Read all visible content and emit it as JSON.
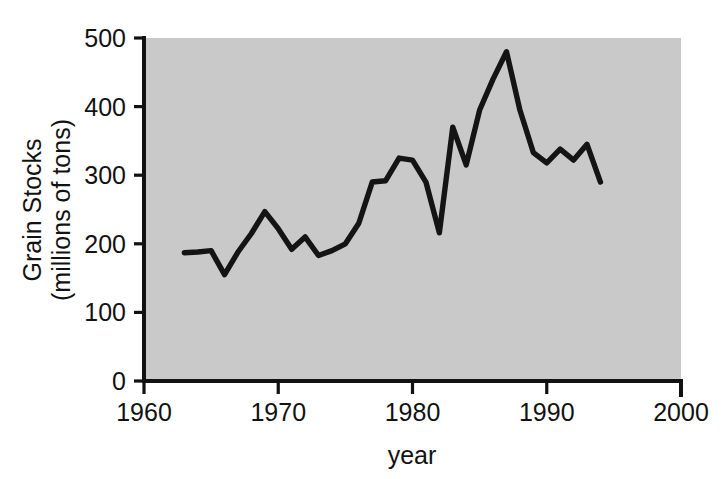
{
  "chart_data": {
    "type": "line",
    "title": "",
    "subtitle": "",
    "xlabel": "year",
    "ylabel_line1": "Grain Stocks",
    "ylabel_line2": "(millions of tons)",
    "ylabel": "Grain Stocks (millions of tons)",
    "xlim": [
      1960,
      2000
    ],
    "ylim": [
      0,
      500
    ],
    "xticks": [
      1960,
      1970,
      1980,
      1990,
      2000
    ],
    "xtick_labels": [
      "1960",
      "1970",
      "1980",
      "1990",
      "2000"
    ],
    "yticks": [
      0,
      100,
      200,
      300,
      400,
      500
    ],
    "ytick_labels": [
      "0",
      "100",
      "200",
      "300",
      "400",
      "500"
    ],
    "grid": false,
    "legend": null,
    "plot_background_color": "#c9c9c9",
    "line_color": "#141414",
    "series": [
      {
        "name": "Grain Stocks",
        "x": [
          1963,
          1964,
          1965,
          1966,
          1967,
          1968,
          1969,
          1970,
          1971,
          1972,
          1973,
          1974,
          1975,
          1976,
          1977,
          1978,
          1979,
          1980,
          1981,
          1982,
          1983,
          1984,
          1985,
          1986,
          1987,
          1988,
          1989,
          1990,
          1991,
          1992,
          1993,
          1994
        ],
        "values": [
          187,
          188,
          190,
          155,
          188,
          215,
          247,
          222,
          192,
          210,
          183,
          190,
          200,
          230,
          290,
          292,
          325,
          322,
          290,
          216,
          370,
          315,
          395,
          440,
          480,
          395,
          333,
          318,
          338,
          322,
          345,
          290
        ]
      }
    ]
  },
  "figure": {
    "xaxis_label": "year",
    "yaxis_label_line1": "Grain Stocks",
    "yaxis_label_line2": "(millions of tons)"
  }
}
